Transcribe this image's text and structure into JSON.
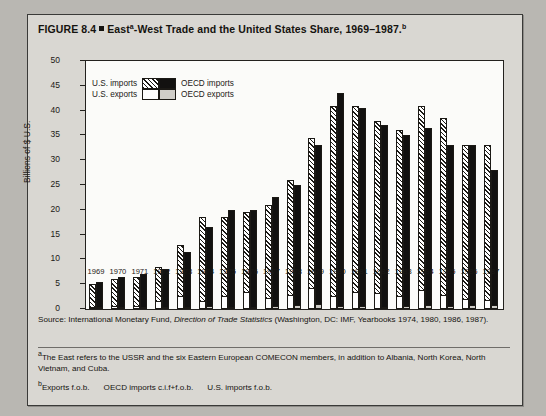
{
  "figure": {
    "title_prefix": "FIGURE 8.4",
    "title_main_1": "East",
    "title_sup_a": "a",
    "title_main_2": "-West Trade and the United States Share, 1969–1987.",
    "title_sup_b": "b"
  },
  "legend": {
    "us_imports": "U.S. imports",
    "us_exports": "U.S. exports",
    "oecd_imports": "OECD imports",
    "oecd_exports": "OECD exports"
  },
  "source": {
    "label": "Source:",
    "text_1": " International Monetary Fund, ",
    "italic": "Direction of Trade Statistics",
    "text_2": " (Washington, DC: IMF, Yearbooks 1974, 1980, 1986, 1987)."
  },
  "notes": {
    "a_marker": "a",
    "a_text": "The East refers to the USSR and the six Eastern European COMECON members, in addition to Albania, North Korea, North Vietnam, and Cuba.",
    "b_marker": "b",
    "b_text_1": "Exports f.o.b.",
    "b_text_2": "OECD imports c.i.f+f.o.b.",
    "b_text_3": "U.S. imports f.o.b."
  },
  "chart_data": {
    "type": "bar",
    "xlabel": "",
    "ylabel": "Billions of $ U.S.",
    "ylim": [
      0,
      50
    ],
    "ytick_values": [
      0,
      5,
      10,
      15,
      20,
      25,
      30,
      35,
      40,
      45,
      50
    ],
    "ytick_labels": [
      "0",
      "5",
      "10",
      "15",
      "20",
      "25",
      "30",
      "35",
      "40",
      "45",
      "50"
    ],
    "grid": false,
    "legend_position": "upper-left-inside",
    "stacked": true,
    "bars_per_category": 2,
    "categories": [
      "1969",
      "1970",
      "1971",
      "1972",
      "1973",
      "1974",
      "1975",
      "1976",
      "1977",
      "1978",
      "1979",
      "1980",
      "1981",
      "1982",
      "1983",
      "1984",
      "1985",
      "1986",
      "1987"
    ],
    "series": [
      {
        "name": "OECD exports",
        "bar_index": 0,
        "segment": "top",
        "swatch_color": "#cfcdc8",
        "pattern": "hatch-diagonal",
        "values": [
          5.0,
          6.0,
          6.5,
          8.5,
          13.0,
          18.5,
          18.5,
          19.5,
          21.0,
          26.0,
          34.5,
          41.0,
          41.0,
          38.0,
          36.0,
          41.0,
          38.5,
          33.0,
          33.0
        ]
      },
      {
        "name": "U.S. exports",
        "bar_index": 0,
        "segment": "base",
        "swatch_color": "#ffffff",
        "pattern": "solid-white",
        "values": [
          0.3,
          0.4,
          0.4,
          1.4,
          2.5,
          1.5,
          2.4,
          3.2,
          2.0,
          2.6,
          4.0,
          2.5,
          3.2,
          3.0,
          2.5,
          3.6,
          2.7,
          1.8,
          1.6
        ]
      },
      {
        "name": "OECD imports",
        "bar_index": 1,
        "segment": "top",
        "swatch_color": "#121110",
        "pattern": "solid-black",
        "values": [
          5.5,
          6.5,
          7.0,
          8.0,
          11.5,
          16.5,
          20.0,
          20.0,
          22.5,
          25.0,
          33.0,
          43.5,
          40.5,
          37.0,
          35.0,
          36.5,
          33.0,
          33.0,
          28.0
        ]
      },
      {
        "name": "U.S. imports",
        "bar_index": 1,
        "segment": "base",
        "swatch_color": "#cfcdc8",
        "pattern": "dotted-gray",
        "values": [
          0.2,
          0.2,
          0.2,
          0.2,
          0.3,
          0.4,
          0.3,
          0.3,
          0.4,
          0.6,
          0.9,
          0.5,
          0.5,
          0.3,
          0.4,
          0.6,
          0.5,
          0.7,
          0.6
        ]
      }
    ]
  }
}
